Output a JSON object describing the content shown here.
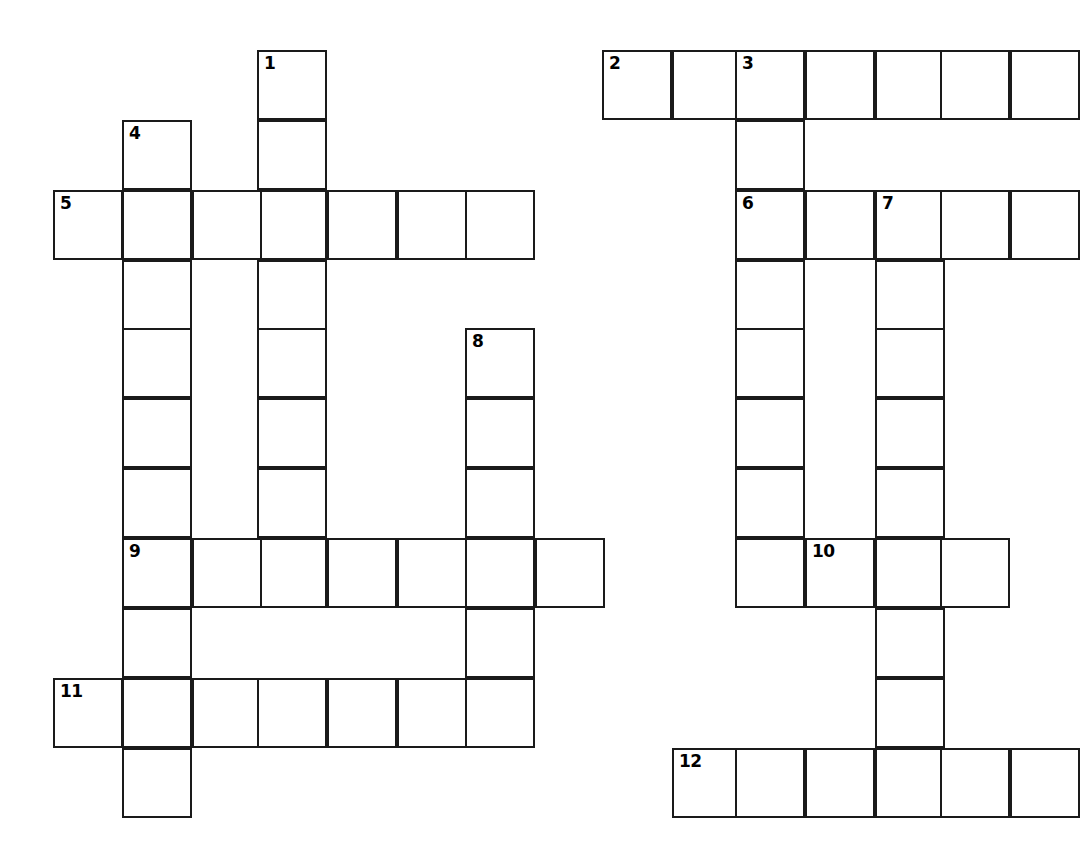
{
  "puzzle": {
    "type": "crossword-grid",
    "title": "",
    "geometry": {
      "image_width": 1059,
      "image_height": 861,
      "cell_size": 70,
      "origin_x": 53,
      "origin_y": 50,
      "border_color": "#1a1a1a",
      "cell_fill": "#ffffff",
      "background": "#ffffff",
      "border_width": 2
    },
    "column_x": [
      53,
      122,
      192,
      257,
      327,
      397,
      465,
      535,
      602,
      672,
      735,
      805,
      875,
      940
    ],
    "row_y": [
      50,
      120,
      190,
      260,
      328,
      398,
      468,
      538,
      608,
      678,
      748,
      818
    ],
    "entries": [
      {
        "number": "1",
        "direction": "down",
        "row": 0,
        "col": 3,
        "length": 8
      },
      {
        "number": "2",
        "direction": "across",
        "row": 0,
        "col": 8,
        "length": 7
      },
      {
        "number": "3",
        "direction": "down",
        "row": 0,
        "col": 10,
        "length": 8
      },
      {
        "number": "4",
        "direction": "down",
        "row": 1,
        "col": 1,
        "length": 10
      },
      {
        "number": "5",
        "direction": "across",
        "row": 2,
        "col": 0,
        "length": 7
      },
      {
        "number": "6",
        "direction": "across",
        "row": 2,
        "col": 10,
        "length": 6
      },
      {
        "number": "7",
        "direction": "down",
        "row": 2,
        "col": 12,
        "length": 9
      },
      {
        "number": "8",
        "direction": "down",
        "row": 4,
        "col": 6,
        "length": 6
      },
      {
        "number": "9",
        "direction": "across",
        "row": 7,
        "col": 1,
        "length": 8
      },
      {
        "number": "10",
        "direction": "across",
        "row": 7,
        "col": 11,
        "length": 4
      },
      {
        "number": "11",
        "direction": "across",
        "row": 9,
        "col": 0,
        "length": 6
      },
      {
        "number": "12",
        "direction": "across",
        "row": 10,
        "col": 9,
        "length": 6
      }
    ],
    "cells": [
      {
        "id": "c-r0-3",
        "row": 0,
        "col": 3,
        "number": "1",
        "letter": ""
      },
      {
        "id": "c-r1-3",
        "row": 1,
        "col": 3,
        "number": "",
        "letter": ""
      },
      {
        "id": "c-r2-3",
        "row": 2,
        "col": 3,
        "number": "",
        "letter": ""
      },
      {
        "id": "c-r3-3",
        "row": 3,
        "col": 3,
        "number": "",
        "letter": ""
      },
      {
        "id": "c-r4-3",
        "row": 4,
        "col": 3,
        "number": "",
        "letter": ""
      },
      {
        "id": "c-r5-3",
        "row": 5,
        "col": 3,
        "number": "",
        "letter": ""
      },
      {
        "id": "c-r6-3",
        "row": 6,
        "col": 3,
        "number": "",
        "letter": ""
      },
      {
        "id": "c-r7-3",
        "row": 7,
        "col": 3,
        "number": "",
        "letter": ""
      },
      {
        "id": "c-r0-8",
        "row": 0,
        "col": 8,
        "number": "2",
        "letter": ""
      },
      {
        "id": "c-r0-9",
        "row": 0,
        "col": 9,
        "number": "",
        "letter": ""
      },
      {
        "id": "c-r0-10",
        "row": 0,
        "col": 10,
        "number": "3",
        "letter": ""
      },
      {
        "id": "c-r0-11",
        "row": 0,
        "col": 11,
        "number": "",
        "letter": ""
      },
      {
        "id": "c-r0-12",
        "row": 0,
        "col": 12,
        "number": "",
        "letter": ""
      },
      {
        "id": "c-r0-13",
        "row": 0,
        "col": 13,
        "number": "",
        "letter": ""
      },
      {
        "id": "c-r0-14",
        "row": 0,
        "col": 14,
        "number": "",
        "letter": ""
      },
      {
        "id": "c-r1-10",
        "row": 1,
        "col": 10,
        "number": "",
        "letter": ""
      },
      {
        "id": "c-r2-10",
        "row": 2,
        "col": 10,
        "number": "6",
        "letter": ""
      },
      {
        "id": "c-r3-10",
        "row": 3,
        "col": 10,
        "number": "",
        "letter": ""
      },
      {
        "id": "c-r4-10",
        "row": 4,
        "col": 10,
        "number": "",
        "letter": ""
      },
      {
        "id": "c-r5-10",
        "row": 5,
        "col": 10,
        "number": "",
        "letter": ""
      },
      {
        "id": "c-r6-10",
        "row": 6,
        "col": 10,
        "number": "",
        "letter": ""
      },
      {
        "id": "c-r7-10",
        "row": 7,
        "col": 10,
        "number": "",
        "letter": ""
      },
      {
        "id": "c-r1-1",
        "row": 1,
        "col": 1,
        "number": "4",
        "letter": ""
      },
      {
        "id": "c-r2-1",
        "row": 2,
        "col": 1,
        "number": "",
        "letter": ""
      },
      {
        "id": "c-r3-1",
        "row": 3,
        "col": 1,
        "number": "",
        "letter": ""
      },
      {
        "id": "c-r4-1",
        "row": 4,
        "col": 1,
        "number": "",
        "letter": ""
      },
      {
        "id": "c-r5-1",
        "row": 5,
        "col": 1,
        "number": "",
        "letter": ""
      },
      {
        "id": "c-r6-1",
        "row": 6,
        "col": 1,
        "number": "",
        "letter": ""
      },
      {
        "id": "c-r7-1",
        "row": 7,
        "col": 1,
        "number": "9",
        "letter": ""
      },
      {
        "id": "c-r8-1",
        "row": 8,
        "col": 1,
        "number": "",
        "letter": ""
      },
      {
        "id": "c-r9-1",
        "row": 9,
        "col": 1,
        "number": "",
        "letter": ""
      },
      {
        "id": "c-r10-1",
        "row": 10,
        "col": 1,
        "number": "",
        "letter": ""
      },
      {
        "id": "c-r2-0",
        "row": 2,
        "col": 0,
        "number": "5",
        "letter": ""
      },
      {
        "id": "c-r2-2",
        "row": 2,
        "col": 2,
        "number": "",
        "letter": ""
      },
      {
        "id": "c-r2-4",
        "row": 2,
        "col": 4,
        "number": "",
        "letter": ""
      },
      {
        "id": "c-r2-5",
        "row": 2,
        "col": 5,
        "number": "",
        "letter": ""
      },
      {
        "id": "c-r2-6",
        "row": 2,
        "col": 6,
        "number": "",
        "letter": ""
      },
      {
        "id": "c-r2-11",
        "row": 2,
        "col": 11,
        "number": "",
        "letter": ""
      },
      {
        "id": "c-r2-12",
        "row": 2,
        "col": 12,
        "number": "7",
        "letter": ""
      },
      {
        "id": "c-r2-13",
        "row": 2,
        "col": 13,
        "number": "",
        "letter": ""
      },
      {
        "id": "c-r2-14",
        "row": 2,
        "col": 14,
        "number": "",
        "letter": ""
      },
      {
        "id": "c-r3-12",
        "row": 3,
        "col": 12,
        "number": "",
        "letter": ""
      },
      {
        "id": "c-r4-12",
        "row": 4,
        "col": 12,
        "number": "",
        "letter": ""
      },
      {
        "id": "c-r5-12",
        "row": 5,
        "col": 12,
        "number": "",
        "letter": ""
      },
      {
        "id": "c-r6-12",
        "row": 6,
        "col": 12,
        "number": "",
        "letter": ""
      },
      {
        "id": "c-r7-12",
        "row": 7,
        "col": 12,
        "number": "",
        "letter": ""
      },
      {
        "id": "c-r8-12",
        "row": 8,
        "col": 12,
        "number": "",
        "letter": ""
      },
      {
        "id": "c-r9-12",
        "row": 9,
        "col": 12,
        "number": "",
        "letter": ""
      },
      {
        "id": "c-r10-12",
        "row": 10,
        "col": 12,
        "number": "",
        "letter": ""
      },
      {
        "id": "c-r4-6",
        "row": 4,
        "col": 6,
        "number": "8",
        "letter": ""
      },
      {
        "id": "c-r5-6",
        "row": 5,
        "col": 6,
        "number": "",
        "letter": ""
      },
      {
        "id": "c-r6-6",
        "row": 6,
        "col": 6,
        "number": "",
        "letter": ""
      },
      {
        "id": "c-r7-6",
        "row": 7,
        "col": 6,
        "number": "",
        "letter": ""
      },
      {
        "id": "c-r8-6",
        "row": 8,
        "col": 6,
        "number": "",
        "letter": ""
      },
      {
        "id": "c-r9-6",
        "row": 9,
        "col": 6,
        "number": "",
        "letter": ""
      },
      {
        "id": "c-r7-2",
        "row": 7,
        "col": 2,
        "number": "",
        "letter": ""
      },
      {
        "id": "c-r7-4",
        "row": 7,
        "col": 4,
        "number": "",
        "letter": ""
      },
      {
        "id": "c-r7-5",
        "row": 7,
        "col": 5,
        "number": "",
        "letter": ""
      },
      {
        "id": "c-r7-7",
        "row": 7,
        "col": 7,
        "number": "",
        "letter": ""
      },
      {
        "id": "c-r7-11",
        "row": 7,
        "col": 11,
        "number": "10",
        "letter": ""
      },
      {
        "id": "c-r7-13",
        "row": 7,
        "col": 13,
        "number": "",
        "letter": ""
      },
      {
        "id": "c-r9-0",
        "row": 9,
        "col": 0,
        "number": "11",
        "letter": ""
      },
      {
        "id": "c-r9-2",
        "row": 9,
        "col": 2,
        "number": "",
        "letter": ""
      },
      {
        "id": "c-r9-3",
        "row": 9,
        "col": 3,
        "number": "",
        "letter": ""
      },
      {
        "id": "c-r9-4",
        "row": 9,
        "col": 4,
        "number": "",
        "letter": ""
      },
      {
        "id": "c-r9-5",
        "row": 9,
        "col": 5,
        "number": "",
        "letter": ""
      },
      {
        "id": "c-r10-9",
        "row": 10,
        "col": 9,
        "number": "12",
        "letter": ""
      },
      {
        "id": "c-r10-10",
        "row": 10,
        "col": 10,
        "number": "",
        "letter": ""
      },
      {
        "id": "c-r10-11",
        "row": 10,
        "col": 11,
        "number": "",
        "letter": ""
      },
      {
        "id": "c-r10-13",
        "row": 10,
        "col": 13,
        "number": "",
        "letter": ""
      },
      {
        "id": "c-r10-14",
        "row": 10,
        "col": 14,
        "number": "",
        "letter": ""
      }
    ]
  }
}
